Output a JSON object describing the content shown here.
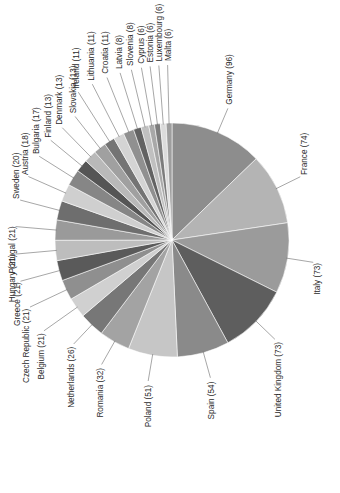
{
  "caption": {
    "text": "Chart 1.  Number of MEPs from each state, 2017."
  },
  "chart_data": {
    "type": "pie",
    "subtitle": "",
    "xlabel": "",
    "ylabel": "",
    "value_label": "Number of MEPs",
    "total": 751,
    "units": "MEPs",
    "year": 2017,
    "legend": "none",
    "grid": false,
    "label_format": "{name} ({value})",
    "rotation_deg": -90,
    "start_angle_deg": -90,
    "direction": "clockwise",
    "categories": [
      "Germany",
      "France",
      "Italy",
      "United Kingdom",
      "Spain",
      "Poland",
      "Romania",
      "Netherlands",
      "Belgium",
      "Czech Republic",
      "Greece",
      "Hungary",
      "Portugal",
      "Sweden",
      "Austria",
      "Bulgaria",
      "Denmark",
      "Finland",
      "Slovakia",
      "Ireland",
      "Lithuania",
      "Croatia",
      "Latvia",
      "Slovenia",
      "Cyprus",
      "Estonia",
      "Luxembourg",
      "Malta"
    ],
    "values": [
      96,
      74,
      73,
      73,
      54,
      51,
      32,
      26,
      21,
      21,
      21,
      21,
      21,
      20,
      18,
      17,
      13,
      13,
      13,
      11,
      11,
      11,
      8,
      8,
      6,
      6,
      6,
      6
    ],
    "colors": [
      "#8d8d8d",
      "#b4b4b4",
      "#9b9b9b",
      "#5e5e5e",
      "#8a8a8a",
      "#c6c6c6",
      "#a3a3a3",
      "#777777",
      "#d0d0d0",
      "#8f8f8f",
      "#5a5a5a",
      "#bdbdbd",
      "#9a9a9a",
      "#6e6e6e",
      "#cfcfcf",
      "#868686",
      "#555555",
      "#b9b9b9",
      "#a0a0a0",
      "#747474",
      "#d4d4d4",
      "#909090",
      "#626262",
      "#c0c0c0",
      "#a8a8a8",
      "#7c7c7c",
      "#dcdcdc",
      "#9e9e9e"
    ],
    "slices": [
      {
        "name": "Germany",
        "value": 96,
        "label": "Germany (96)",
        "color": "#8d8d8d"
      },
      {
        "name": "France",
        "value": 74,
        "label": "France (74)",
        "color": "#b4b4b4"
      },
      {
        "name": "Italy",
        "value": 73,
        "label": "Italy (73)",
        "color": "#9b9b9b"
      },
      {
        "name": "United Kingdom",
        "value": 73,
        "label": "United Kingdom (73)",
        "color": "#5e5e5e"
      },
      {
        "name": "Spain",
        "value": 54,
        "label": "Spain (54)",
        "color": "#8a8a8a"
      },
      {
        "name": "Poland",
        "value": 51,
        "label": "Poland (51)",
        "color": "#c6c6c6"
      },
      {
        "name": "Romania",
        "value": 32,
        "label": "Romania (32)",
        "color": "#a3a3a3"
      },
      {
        "name": "Netherlands",
        "value": 26,
        "label": "Netherlands (26)",
        "color": "#777777"
      },
      {
        "name": "Belgium",
        "value": 21,
        "label": "Belgium (21)",
        "color": "#d0d0d0"
      },
      {
        "name": "Czech Republic",
        "value": 21,
        "label": "Czech Republic (21)",
        "color": "#8f8f8f"
      },
      {
        "name": "Greece",
        "value": 21,
        "label": "Greece (21)",
        "color": "#5a5a5a"
      },
      {
        "name": "Hungary",
        "value": 21,
        "label": "Hungary (21)",
        "color": "#bdbdbd"
      },
      {
        "name": "Portugal",
        "value": 21,
        "label": "Portugal (21)",
        "color": "#9a9a9a"
      },
      {
        "name": "Sweden",
        "value": 20,
        "label": "Sweden (20)",
        "color": "#6e6e6e"
      },
      {
        "name": "Austria",
        "value": 18,
        "label": "Austria (18)",
        "color": "#cfcfcf"
      },
      {
        "name": "Bulgaria",
        "value": 17,
        "label": "Bulgaria (17)",
        "color": "#868686"
      },
      {
        "name": "Finland",
        "value": 13,
        "label": "Finland (13)",
        "color": "#555555"
      },
      {
        "name": "Denmark",
        "value": 13,
        "label": "Denmark (13)",
        "color": "#b9b9b9"
      },
      {
        "name": "Slovakia",
        "value": 13,
        "label": "Slovakia (13)",
        "color": "#a0a0a0"
      },
      {
        "name": "Ireland",
        "value": 11,
        "label": "Ireland (11)",
        "color": "#747474"
      },
      {
        "name": "Lithuania",
        "value": 11,
        "label": "Lithuania (11)",
        "color": "#d4d4d4"
      },
      {
        "name": "Croatia",
        "value": 11,
        "label": "Croatia (11)",
        "color": "#909090"
      },
      {
        "name": "Latvia",
        "value": 8,
        "label": "Latvia (8)",
        "color": "#626262"
      },
      {
        "name": "Slovenia",
        "value": 8,
        "label": "Slovenia (8)",
        "color": "#c0c0c0"
      },
      {
        "name": "Cyprus",
        "value": 6,
        "label": "Cyprus (6)",
        "color": "#a8a8a8"
      },
      {
        "name": "Estonia",
        "value": 6,
        "label": "Estonia (6)",
        "color": "#7c7c7c"
      },
      {
        "name": "Luxembourg",
        "value": 6,
        "label": "Luxembourg (6)",
        "color": "#dcdcdc"
      },
      {
        "name": "Malta",
        "value": 6,
        "label": "Malta (6)",
        "color": "#9e9e9e"
      }
    ],
    "geometry": {
      "cx": 172,
      "cy": 240,
      "r": 117
    }
  }
}
